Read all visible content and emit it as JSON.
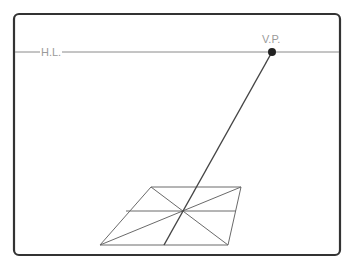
{
  "diagram": {
    "labels": {
      "horizon_line": "H.L.",
      "vanishing_point": "V.P."
    },
    "colors": {
      "frame": "#333333",
      "horizon": "#8a8a8a",
      "lines": "#666666",
      "vp_line": "#444444",
      "vp_dot": "#222222",
      "label": "#9a9a9a"
    }
  }
}
